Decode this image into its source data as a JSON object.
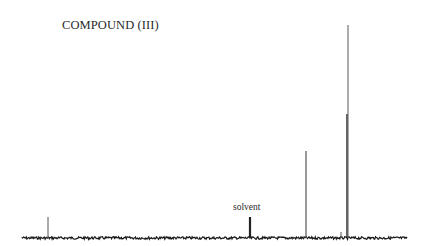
{
  "title": "COMPOUND (III)",
  "annotations": {
    "solvent_label": "solvent"
  },
  "chart_data": {
    "type": "line",
    "title": "COMPOUND (III)",
    "subtitle": "",
    "xlabel": "",
    "ylabel": "",
    "axis_ticks": "none shown",
    "grid": false,
    "legend": "none",
    "baseline_pixel": {
      "y": 238,
      "x_start": 22,
      "x_end": 407
    },
    "peaks": [
      {
        "id": "p1",
        "x_px": 48,
        "top_px": 217,
        "relative_height": 0.1,
        "label": ""
      },
      {
        "id": "solvent",
        "x_px": 250,
        "top_px": 217,
        "relative_height": 0.1,
        "label": "solvent"
      },
      {
        "id": "p2",
        "x_px": 306,
        "top_px": 151,
        "relative_height": 0.41,
        "label": ""
      },
      {
        "id": "p3_minor",
        "x_px": 341,
        "top_px": 232,
        "relative_height": 0.03,
        "label": ""
      },
      {
        "id": "p4",
        "x_px": 347,
        "top_px": 114,
        "relative_height": 0.58,
        "label": ""
      },
      {
        "id": "p5",
        "x_px": 348,
        "top_px": 25,
        "relative_height": 1.0,
        "label": ""
      }
    ],
    "annotations": [
      {
        "text": "solvent",
        "x_px": 250,
        "y_px": 207
      }
    ]
  }
}
